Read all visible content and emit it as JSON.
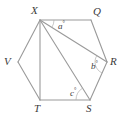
{
  "figure": {
    "type": "polygon-with-diagonals",
    "stroke_color": "#9a9a9a",
    "label_color": "#3b3b3b",
    "background_color": "#ffffff",
    "vertices": [
      {
        "name": "X",
        "label": "X",
        "x": 40,
        "y": 20,
        "label_x": 31,
        "label_y": 5
      },
      {
        "name": "Q",
        "label": "Q",
        "x": 91,
        "y": 20,
        "label_x": 93,
        "label_y": 6
      },
      {
        "name": "R",
        "label": "R",
        "x": 107,
        "y": 62,
        "label_x": 110,
        "label_y": 56
      },
      {
        "name": "S",
        "label": "S",
        "x": 90,
        "y": 100,
        "label_x": 86,
        "label_y": 103
      },
      {
        "name": "T",
        "label": "T",
        "x": 40,
        "y": 100,
        "label_x": 34,
        "label_y": 103
      },
      {
        "name": "V",
        "label": "V",
        "x": 18,
        "y": 62,
        "label_x": 4,
        "label_y": 56
      }
    ],
    "edges": [
      {
        "name": "edge-XQ",
        "from": "X",
        "to": "Q"
      },
      {
        "name": "edge-QR",
        "from": "Q",
        "to": "R"
      },
      {
        "name": "edge-RS",
        "from": "R",
        "to": "S"
      },
      {
        "name": "edge-ST",
        "from": "S",
        "to": "T"
      },
      {
        "name": "edge-TV",
        "from": "T",
        "to": "V"
      },
      {
        "name": "edge-VX",
        "from": "V",
        "to": "X"
      }
    ],
    "diagonals": [
      {
        "name": "diagonal-XR",
        "from": "X",
        "to": "R"
      },
      {
        "name": "diagonal-XS",
        "from": "X",
        "to": "S"
      },
      {
        "name": "diagonal-XT",
        "from": "X",
        "to": "T"
      }
    ],
    "angles": [
      {
        "name": "angle-a",
        "symbol": "a",
        "unit": "°",
        "at_vertex": "X",
        "between": [
          "Q",
          "R"
        ],
        "label_x": 58,
        "label_y": 20,
        "arc_cx": 40,
        "arc_cy": 20,
        "arc_r": 14
      },
      {
        "name": "angle-b",
        "symbol": "b",
        "unit": "°",
        "at_vertex": "R",
        "between": [
          "X",
          "S"
        ],
        "label_x": 91,
        "label_y": 60,
        "arc_cx": 107,
        "arc_cy": 62,
        "arc_r": 12
      },
      {
        "name": "angle-c",
        "symbol": "c",
        "unit": "°",
        "at_vertex": "S",
        "between": [
          "X",
          "T"
        ],
        "label_x": 70,
        "label_y": 87,
        "arc_cx": 90,
        "arc_cy": 100,
        "arc_r": 14
      }
    ]
  }
}
